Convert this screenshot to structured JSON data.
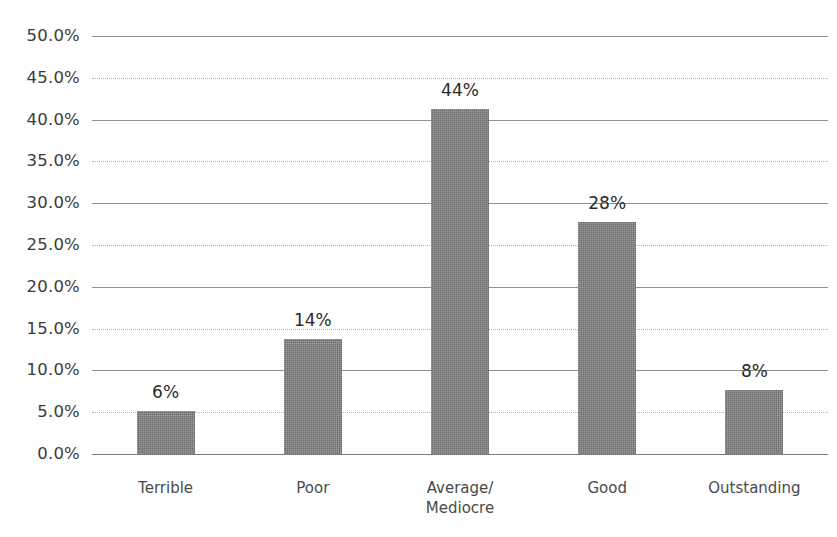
{
  "chart_data": {
    "type": "bar",
    "title": "",
    "subtitle": "",
    "xlabel": "",
    "ylabel": "",
    "categories": [
      "Terrible",
      "Poor",
      "Average/\nMediocre",
      "Good",
      "Outstanding"
    ],
    "values": [
      5.2,
      13.8,
      41.3,
      27.7,
      7.7
    ],
    "data_labels": [
      "6%",
      "14%",
      "44%",
      "28%",
      "8%"
    ],
    "ylim": [
      0,
      50
    ],
    "ytick_values": [
      50,
      45,
      40,
      35,
      30,
      25,
      20,
      15,
      10,
      5,
      0
    ],
    "ytick_labels": [
      "50.0%",
      "45.0%",
      "40.0%",
      "35.0%",
      "30.0%",
      "25.0%",
      "20.0%",
      "15.0%",
      "10.0%",
      "5.0%",
      "0.0%"
    ],
    "grid": true,
    "legend": false,
    "legend_position": "none",
    "series": [
      {
        "name": "Rating distribution",
        "values": [
          5.2,
          13.8,
          41.3,
          27.7,
          7.7
        ]
      }
    ],
    "colors": {
      "bar_fill": "#6e6e6e",
      "gridline_major": "#8f8f8f",
      "gridline_minor": "#b0b0b0",
      "axis_line": "#7a7a7a",
      "tick_label": "#3b3b3b",
      "category_label": "#4a4a4a",
      "data_label": "#2a2a2a",
      "background": "#ffffff"
    }
  }
}
